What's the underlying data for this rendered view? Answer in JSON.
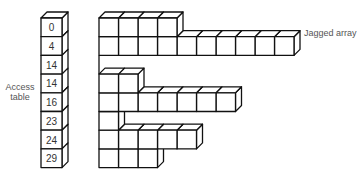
{
  "labels": {
    "access_table": "Access\ntable",
    "access_table_line1": "Access",
    "access_table_line2": "table",
    "jagged_array": "Jagged array"
  },
  "access_table": {
    "values": [
      "0",
      "4",
      "14",
      "14",
      "16",
      "23",
      "24",
      "29"
    ]
  },
  "jagged_array": {
    "row_lengths": [
      4,
      10,
      0,
      2,
      7,
      1,
      5,
      3
    ]
  },
  "colors": {
    "stroke": "#111111",
    "fill": "#ffffff",
    "text": "#333333",
    "label": "#555555"
  }
}
